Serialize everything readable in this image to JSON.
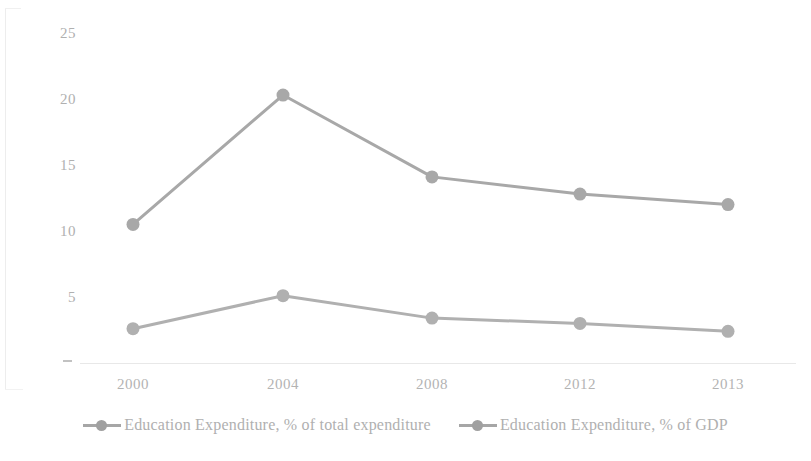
{
  "chart_data": {
    "type": "line",
    "title": "",
    "subtitle": "",
    "xlabel": "",
    "ylabel": "",
    "categories": [
      "2000",
      "2004",
      "2008",
      "2012",
      "2013"
    ],
    "series": [
      {
        "name": "Education Expenditure, % of total expenditure",
        "values": [
          10.5,
          20.3,
          14.1,
          12.8,
          12.0
        ],
        "color": "#a8a8a8"
      },
      {
        "name": "Education Expenditure, % of GDP",
        "values": [
          2.6,
          5.1,
          3.4,
          3.0,
          2.4
        ],
        "color": "#b0b0b0"
      }
    ],
    "ylim": [
      0,
      25
    ],
    "yticks": [
      "-",
      "5",
      "10",
      "15",
      "20",
      "25"
    ],
    "ytick_values": [
      0,
      5,
      10,
      15,
      20,
      25
    ],
    "grid": false,
    "legend_position": "bottom",
    "marker": "circle"
  },
  "yaxis": {
    "ticks": [
      {
        "label": "25",
        "value": 25
      },
      {
        "label": "20",
        "value": 20
      },
      {
        "label": "15",
        "value": 15
      },
      {
        "label": "10",
        "value": 10
      },
      {
        "label": "5",
        "value": 5
      },
      {
        "label": "-",
        "value": 0
      }
    ]
  },
  "xaxis": {
    "ticks": [
      "2000",
      "2004",
      "2008",
      "2012",
      "2013"
    ]
  },
  "legend": {
    "items": [
      {
        "label": "Education Expenditure, % of total expenditure"
      },
      {
        "label": "Education Expenditure, % of GDP"
      }
    ]
  },
  "colors": {
    "series1": "#a8a8a8",
    "series2": "#b0b0b0",
    "text": "#b0b0b0",
    "grid": "#e8e8e8",
    "background": "#ffffff"
  }
}
